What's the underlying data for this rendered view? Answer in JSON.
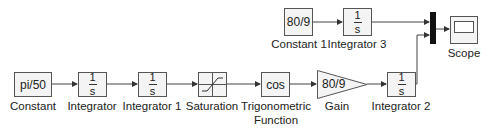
{
  "diagram": {
    "type": "simulink-block-diagram",
    "blocks": {
      "constant": {
        "content": "pi/50",
        "label": "Constant"
      },
      "integrator": {
        "num": "1",
        "den": "s",
        "label": "Integrator"
      },
      "integrator1": {
        "num": "1",
        "den": "s",
        "label": "Integrator 1"
      },
      "saturation": {
        "label": "Saturation"
      },
      "trig": {
        "content": "cos",
        "label_line1": "Trigonometric",
        "label_line2": "Function"
      },
      "gain": {
        "content": "80/9",
        "label": "Gain"
      },
      "integrator2": {
        "num": "1",
        "den": "s",
        "label": "Integrator 2"
      },
      "constant1": {
        "content": "80/9",
        "label": "Constant 1"
      },
      "integrator3": {
        "num": "1",
        "den": "s",
        "label": "Integrator 3"
      },
      "mux": {
        "label": ""
      },
      "scope": {
        "label": "Scope"
      }
    },
    "connections": [
      [
        "Constant",
        "Integrator"
      ],
      [
        "Integrator",
        "Integrator 1"
      ],
      [
        "Integrator 1",
        "Saturation"
      ],
      [
        "Saturation",
        "Trigonometric Function"
      ],
      [
        "Trigonometric Function",
        "Gain"
      ],
      [
        "Gain",
        "Integrator 2"
      ],
      [
        "Integrator 2",
        "Mux"
      ],
      [
        "Constant 1",
        "Integrator 3"
      ],
      [
        "Integrator 3",
        "Mux"
      ],
      [
        "Mux",
        "Scope"
      ]
    ],
    "colors": {
      "line": "#444444",
      "block_fill": "#f4f4f4",
      "mux": "#111111"
    }
  }
}
